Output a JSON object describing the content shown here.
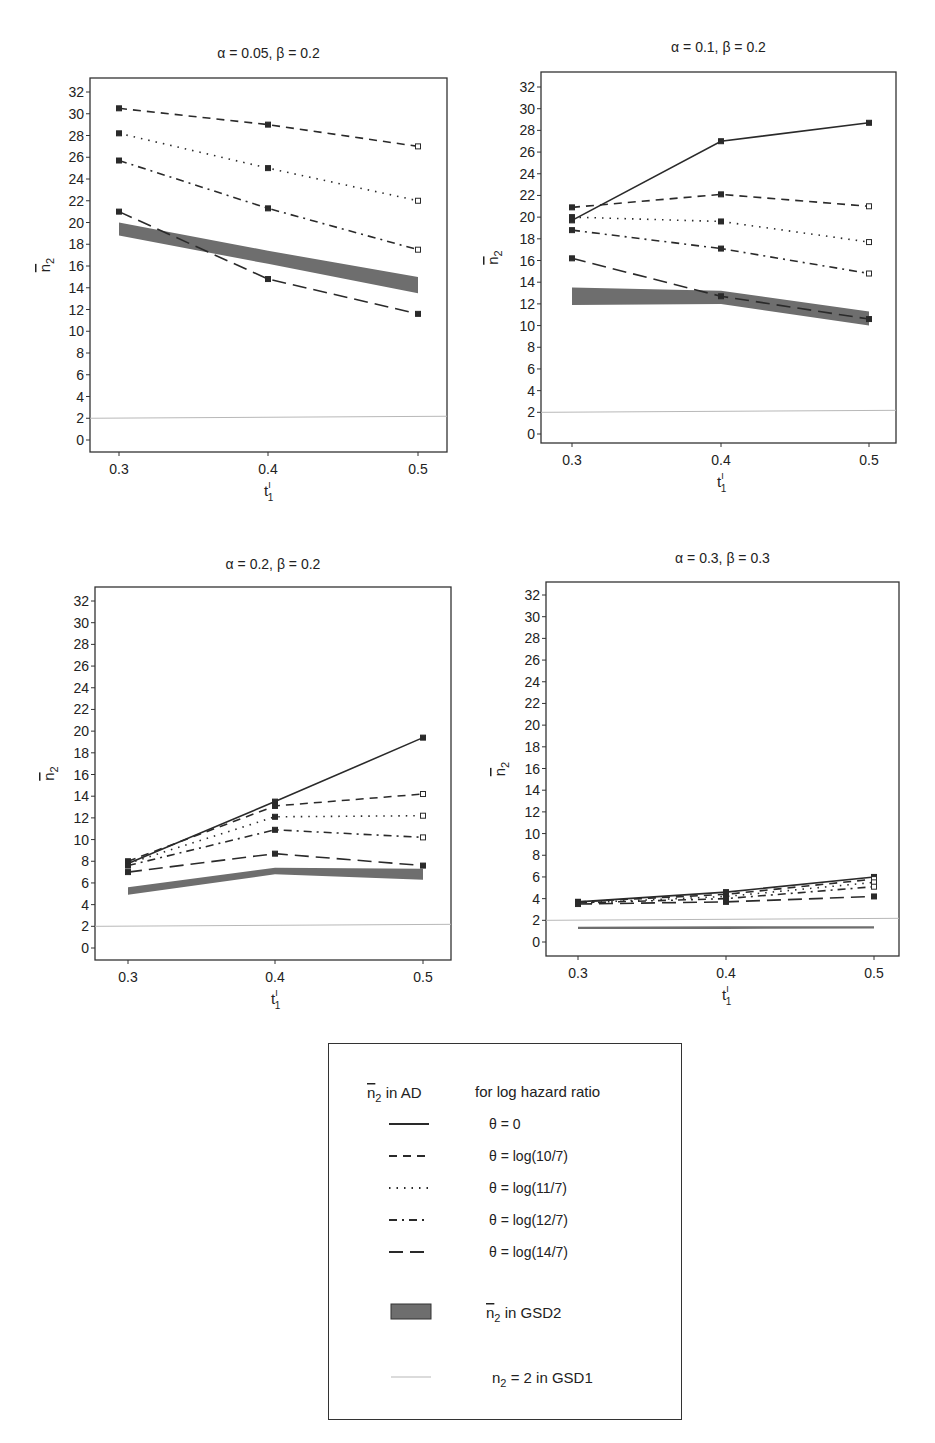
{
  "figure": {
    "y_tick_labels": [
      "0",
      "2",
      "4",
      "6",
      "8",
      "10",
      "12",
      "14",
      "16",
      "18",
      "20",
      "22",
      "24",
      "26",
      "28",
      "30",
      "32"
    ],
    "x_tick_labels": [
      "0.3",
      "0.4",
      "0.5"
    ],
    "xlabel_main": "t",
    "xlabel_sup": "I",
    "xlabel_sub": "1",
    "ylabel_main": "n",
    "ylabel_sub": "2"
  },
  "colors": {
    "line": "#2a2a2a",
    "band": "#6e6e6e",
    "gsd1": "#b8b8b8",
    "frame": "#333333"
  },
  "legend": {
    "header_left_main": "n",
    "header_left_sub": "2",
    "header_left_suffix": " in AD",
    "header_right": "for log hazard ratio",
    "items": [
      {
        "label": "θ = 0",
        "dash": ""
      },
      {
        "label": "θ = log(10/7)",
        "dash": "8,6"
      },
      {
        "label": "θ = log(11/7)",
        "dash": "1.5,6"
      },
      {
        "label": "θ = log(12/7)",
        "dash": "8,5,2,5"
      },
      {
        "label": "θ = log(14/7)",
        "dash": "14,7"
      }
    ],
    "band_label_main": "n",
    "band_label_sub": "2",
    "band_label_suffix": " in GSD2",
    "gsd1_label_main": "n",
    "gsd1_label_sub": "2",
    "gsd1_label_suffix": " = 2  in GSD1"
  },
  "chart_data": [
    {
      "type": "line",
      "title": "α = 0.05, β = 0.2",
      "xlabel": "t1^I",
      "ylabel": "mean n2",
      "x": [
        0.3,
        0.4,
        0.5
      ],
      "ylim": [
        -1,
        33
      ],
      "grid": false,
      "series": [
        {
          "name": "θ = log(10/7)",
          "values": [
            30.5,
            29.0,
            27.0
          ]
        },
        {
          "name": "θ = log(11/7)",
          "values": [
            28.2,
            25.0,
            22.0
          ]
        },
        {
          "name": "θ = log(12/7)",
          "values": [
            25.7,
            21.3,
            17.5
          ]
        },
        {
          "name": "θ = log(14/7)",
          "values": [
            21.0,
            14.8,
            11.6
          ]
        }
      ],
      "gsd2_band": {
        "lower": [
          18.8,
          16.2,
          13.5
        ],
        "upper": [
          20.0,
          17.4,
          15.0
        ]
      },
      "gsd1_line": 2
    },
    {
      "type": "line",
      "title": "α = 0.1, β = 0.2",
      "xlabel": "t1^I",
      "ylabel": "mean n2",
      "x": [
        0.3,
        0.4,
        0.5
      ],
      "ylim": [
        -1,
        33
      ],
      "grid": false,
      "series": [
        {
          "name": "θ = 0",
          "values": [
            19.7,
            27.0,
            28.7
          ]
        },
        {
          "name": "θ = log(10/7)",
          "values": [
            20.9,
            22.1,
            21.0
          ]
        },
        {
          "name": "θ = log(11/7)",
          "values": [
            20.0,
            19.6,
            17.7
          ]
        },
        {
          "name": "θ = log(12/7)",
          "values": [
            18.8,
            17.1,
            14.8
          ]
        },
        {
          "name": "θ = log(14/7)",
          "values": [
            16.2,
            12.7,
            10.6
          ]
        }
      ],
      "gsd2_band": {
        "lower": [
          11.9,
          12.0,
          10.0
        ],
        "upper": [
          13.5,
          13.2,
          11.3
        ]
      },
      "gsd1_line": 2
    },
    {
      "type": "line",
      "title": "α = 0.2, β = 0.2",
      "xlabel": "t1^I",
      "ylabel": "mean n2",
      "x": [
        0.3,
        0.4,
        0.5
      ],
      "ylim": [
        -1,
        33
      ],
      "grid": false,
      "series": [
        {
          "name": "θ = 0",
          "values": [
            7.8,
            13.5,
            19.4
          ]
        },
        {
          "name": "θ = log(10/7)",
          "values": [
            8.0,
            13.1,
            14.2
          ]
        },
        {
          "name": "θ = log(11/7)",
          "values": [
            7.8,
            12.1,
            12.2
          ]
        },
        {
          "name": "θ = log(12/7)",
          "values": [
            7.6,
            10.9,
            10.2
          ]
        },
        {
          "name": "θ = log(14/7)",
          "values": [
            7.0,
            8.7,
            7.6
          ]
        }
      ],
      "gsd2_band": {
        "lower": [
          4.9,
          6.8,
          6.3
        ],
        "upper": [
          5.6,
          7.4,
          7.3
        ]
      },
      "gsd1_line": 2
    },
    {
      "type": "line",
      "title": "α = 0.3, β = 0.3",
      "xlabel": "t1^I",
      "ylabel": "mean n2",
      "x": [
        0.3,
        0.4,
        0.5
      ],
      "ylim": [
        -1,
        33
      ],
      "grid": false,
      "series": [
        {
          "name": "θ = 0",
          "values": [
            3.7,
            4.6,
            6.0
          ]
        },
        {
          "name": "θ = log(10/7)",
          "values": [
            3.7,
            4.4,
            5.8
          ]
        },
        {
          "name": "θ = log(11/7)",
          "values": [
            3.6,
            4.2,
            5.5
          ]
        },
        {
          "name": "θ = log(12/7)",
          "values": [
            3.6,
            4.0,
            5.1
          ]
        },
        {
          "name": "θ = log(14/7)",
          "values": [
            3.5,
            3.7,
            4.2
          ]
        }
      ],
      "gsd2_band": {
        "lower": [
          1.2,
          1.2,
          1.25
        ],
        "upper": [
          1.4,
          1.45,
          1.45
        ]
      },
      "gsd1_line": 2
    }
  ],
  "layout_panels": [
    {
      "frame": [
        90,
        78,
        447,
        452
      ],
      "y0": 440,
      "y32": 92,
      "xs": [
        119,
        268,
        418
      ],
      "title_y": 58,
      "ylabel_x": 50
    },
    {
      "frame": [
        541,
        72,
        896,
        443
      ],
      "y0": 434,
      "y32": 87,
      "xs": [
        572,
        721,
        869
      ],
      "title_y": 52,
      "ylabel_x": 498
    },
    {
      "frame": [
        95,
        587,
        451,
        960
      ],
      "y0": 948,
      "y32": 601,
      "xs": [
        128,
        275,
        423
      ],
      "title_y": 569,
      "ylabel_x": 54
    },
    {
      "frame": [
        546,
        582,
        899,
        956
      ],
      "y0": 942,
      "y32": 595,
      "xs": [
        578,
        726,
        874
      ],
      "title_y": 563,
      "ylabel_x": 505
    }
  ]
}
